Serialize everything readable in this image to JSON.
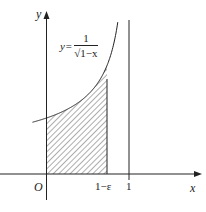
{
  "figure": {
    "type": "function-area-diagram",
    "axes": {
      "x_label": "x",
      "y_label": "y",
      "origin_label": "O"
    },
    "equation": {
      "lhs": "y=",
      "numerator": "1",
      "denominator": "√1−x"
    },
    "x_ticks": [
      {
        "label": "1−ε"
      },
      {
        "label": "1"
      }
    ],
    "shaded_region": "area under curve from 0 to 1−ε (hatched)",
    "asymptote": "x = 1 (vertical line)",
    "colors": {
      "ink": "#222222",
      "background": "#ffffff"
    }
  }
}
